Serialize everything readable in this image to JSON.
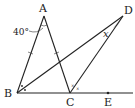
{
  "figure": {
    "points": {
      "A": "A",
      "B": "B",
      "C": "C",
      "D": "D",
      "E": "E"
    },
    "angle_A_label": "40°",
    "angle_D_label": "x",
    "shaded_angle_color": "#c8c8c8",
    "line_color": "#222222"
  }
}
